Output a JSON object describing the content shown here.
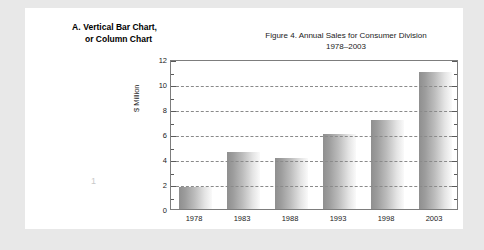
{
  "heading": {
    "marker": "A.",
    "line1": "Vertical Bar Chart,",
    "line2": "or Column Chart"
  },
  "page_number": "1",
  "chart_data": {
    "type": "bar",
    "title": "Figure 4.  Annual Sales for Consumer Division",
    "subtitle": "1978–2003",
    "xlabel": "",
    "ylabel": "$ Million",
    "categories": [
      "1978",
      "1983",
      "1988",
      "1993",
      "1998",
      "2003"
    ],
    "values": [
      1.8,
      4.6,
      4.1,
      6.0,
      7.1,
      11.0
    ],
    "ylim": [
      0,
      12
    ],
    "ytick_values": [
      0,
      2,
      4,
      6,
      8,
      10,
      12
    ],
    "ytick_labels": [
      "0",
      "2",
      "4",
      "6",
      "8",
      "10",
      "12"
    ],
    "yminor_step": 1,
    "grid": "horizontal-dashed",
    "legend": "none",
    "bar_fill": "#9c9c9c",
    "frame_color": "#7d7d7d"
  }
}
